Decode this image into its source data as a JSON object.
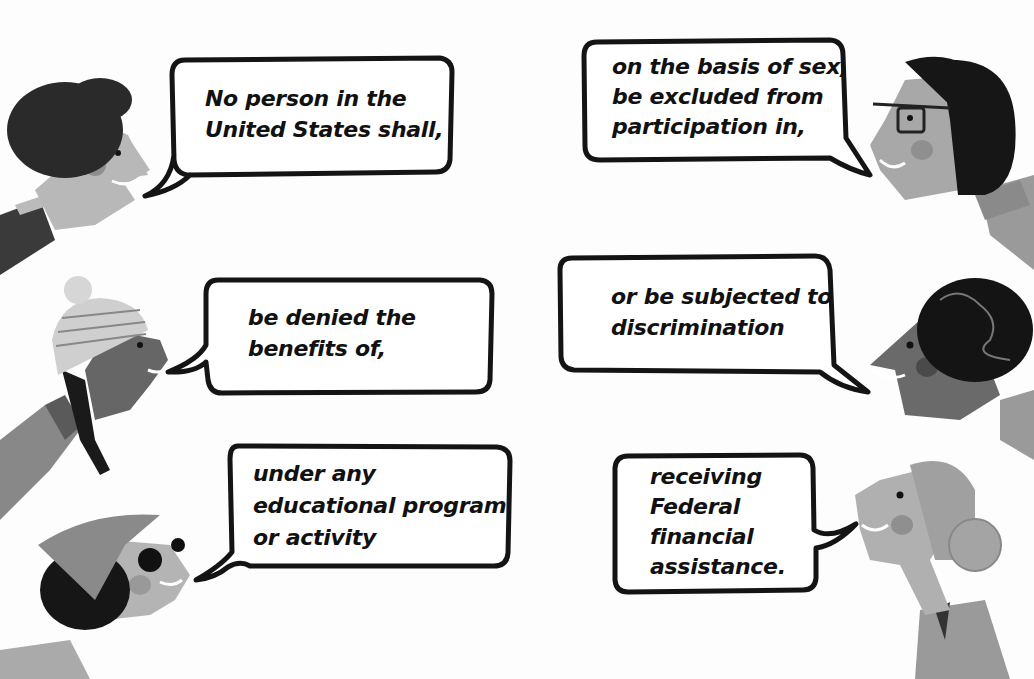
{
  "colors": {
    "background": "#fdfdfd",
    "ink": "#111111",
    "skin_light": "#b8b8b8",
    "skin_dark": "#6e6e6e",
    "hair_dark": "#1a1a1a",
    "cheek": "#8f8f8f"
  },
  "bubbles": [
    {
      "id": "bubble-1",
      "speaker": "curly-hair-person-top-left",
      "lines": [
        "No person in the",
        "United States shall,"
      ]
    },
    {
      "id": "bubble-2",
      "speaker": "glasses-bob-woman-top-right",
      "lines": [
        "on the basis of sex,",
        "be excluded from",
        "participation in,"
      ]
    },
    {
      "id": "bubble-3",
      "speaker": "beanie-braid-girl-middle-left",
      "lines": [
        "be denied the",
        "benefits of,"
      ]
    },
    {
      "id": "bubble-4",
      "speaker": "curly-updo-woman-middle-right",
      "lines": [
        "or be subjected to",
        "discrimination"
      ]
    },
    {
      "id": "bubble-5",
      "speaker": "headscarf-sunglasses-woman-bottom-left",
      "lines": [
        "under any",
        "educational program",
        "or activity"
      ]
    },
    {
      "id": "bubble-6",
      "speaker": "bun-hair-woman-bottom-right",
      "lines": [
        "receiving",
        "Federal",
        "financial",
        "assistance."
      ]
    }
  ]
}
